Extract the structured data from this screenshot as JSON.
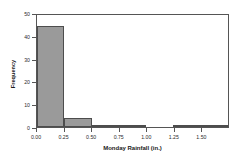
{
  "chart_data": {
    "type": "bar",
    "title": "",
    "xlabel": "Monday Rainfall (in.)",
    "ylabel": "Frequency",
    "grid": false,
    "legend": false,
    "xlim": [
      0.0,
      1.75
    ],
    "ylim": [
      0,
      50
    ],
    "xticks": [
      "0.00",
      "0.25",
      "0.50",
      "0.75",
      "1.00",
      "1.25",
      "1.50"
    ],
    "xtick_values": [
      0.0,
      0.25,
      0.5,
      0.75,
      1.0,
      1.25,
      1.5
    ],
    "yticks": [
      "0",
      "10",
      "20",
      "30",
      "40",
      "50"
    ],
    "ytick_values": [
      0,
      10,
      20,
      30,
      40,
      50
    ],
    "bin_width": 0.25,
    "bin_edges": [
      0.0,
      0.25,
      0.5,
      0.75,
      1.0,
      1.25,
      1.5,
      1.75
    ],
    "categories": [
      "0.00-0.25",
      "0.25-0.50",
      "0.50-0.75",
      "0.75-1.00",
      "1.00-1.25",
      "1.25-1.50",
      "1.50-1.75"
    ],
    "values": [
      45,
      4,
      1,
      1,
      0,
      1,
      1
    ],
    "bar_color": "#9a9a9a",
    "bar_edge_color": "#4d4d4d",
    "axis_color": "#555555"
  }
}
